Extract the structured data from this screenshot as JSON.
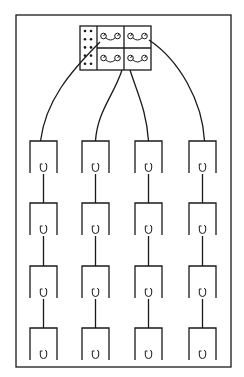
{
  "diagram": {
    "type": "wiring-schematic",
    "frame": {
      "x": 16,
      "y": 15,
      "width": 215,
      "height": 352
    },
    "colors": {
      "ink": "#1a1a1a",
      "background": "#ffffff"
    },
    "hub": {
      "x": 80,
      "y": 26,
      "width": 71,
      "height": 44,
      "dot_column": {
        "cols": 2,
        "rows": 5
      },
      "cells": [
        {
          "row": 0,
          "col": 0,
          "symbol": "two-terminal-link"
        },
        {
          "row": 0,
          "col": 1,
          "symbol": "two-terminal-link"
        },
        {
          "row": 1,
          "col": 0,
          "symbol": "two-terminal-link"
        },
        {
          "row": 1,
          "col": 1,
          "symbol": "two-terminal-link"
        }
      ]
    },
    "columns": [
      {
        "x": 30,
        "feed_from": "hub-top-left"
      },
      {
        "x": 82,
        "feed_from": "hub-bottom-left"
      },
      {
        "x": 135,
        "feed_from": "hub-bottom-right"
      },
      {
        "x": 189,
        "feed_from": "hub-top-right"
      }
    ],
    "rows_y": [
      141,
      203,
      266,
      328
    ],
    "unit": {
      "width": 27,
      "side_height": 32,
      "symbol": "cup-hook"
    },
    "unit_count": 16
  }
}
